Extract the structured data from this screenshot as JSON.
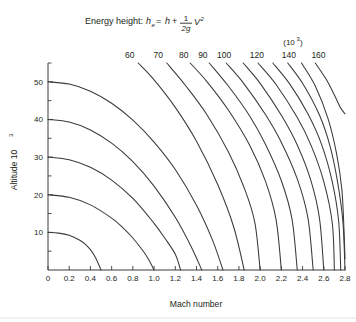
{
  "figure": {
    "background": "#ffffff",
    "line_color": "#3a3a3a",
    "text_color": "#231f20"
  },
  "title": {
    "prefix": "Energy height:",
    "var_he": "h",
    "sub_e": "e",
    "eq": "=",
    "h": "h",
    "plus": "+",
    "num": "1",
    "den": "2g",
    "v": "V",
    "v_exp": "2"
  },
  "exponent_note": {
    "open": "(10",
    "exp": "3",
    "close": ")"
  },
  "axes": {
    "x": {
      "label": "Mach number",
      "ticks": [
        "0",
        "0.2",
        "0.4",
        "0.6",
        "0.8",
        "1.0",
        "1.2",
        "1.4",
        "1.6",
        "1.8",
        "2.0",
        "2.2",
        "2.4",
        "2.6",
        "2.8"
      ],
      "min": 0,
      "max": 2.8,
      "step": 0.2
    },
    "y": {
      "label_main": "Altitude 10",
      "label_exp": "3",
      "ticks": [
        "10",
        "20",
        "30",
        "40",
        "50"
      ],
      "min": 0,
      "max": 55,
      "major_step": 10,
      "minor_step": 5
    }
  },
  "contour_labels": [
    "60",
    "70",
    "80",
    "90",
    "100",
    "120",
    "140",
    "160"
  ],
  "chart_data": {
    "type": "line",
    "xlabel": "Mach number",
    "ylabel": "Altitude 10^3",
    "xlim": [
      0,
      2.8
    ],
    "ylim": [
      0,
      55
    ],
    "grid": false,
    "legend": "none",
    "units_note": "(10^3)",
    "annotation": "Contours of constant energy height; labels in thousands of feet",
    "series": [
      {
        "name": "10",
        "label_shown": false,
        "x": [
          0.0,
          0.1,
          0.2,
          0.3,
          0.35,
          0.4,
          0.45,
          0.5
        ],
        "y": [
          10.0,
          9.8,
          9.2,
          7.9,
          6.9,
          5.4,
          3.2,
          0.0
        ]
      },
      {
        "name": "20",
        "label_shown": false,
        "x": [
          0.0,
          0.2,
          0.4,
          0.6,
          0.7,
          0.8,
          0.9,
          0.95,
          1.0
        ],
        "y": [
          20.0,
          19.3,
          17.3,
          13.8,
          11.4,
          8.5,
          4.9,
          2.7,
          0.0
        ]
      },
      {
        "name": "30",
        "label_shown": false,
        "x": [
          0.0,
          0.2,
          0.4,
          0.6,
          0.8,
          1.0,
          1.1,
          1.2,
          1.25
        ],
        "y": [
          30.0,
          29.3,
          27.3,
          23.9,
          19.0,
          12.4,
          8.5,
          4.2,
          0.0
        ]
      },
      {
        "name": "40",
        "label_shown": false,
        "x": [
          0.0,
          0.2,
          0.4,
          0.6,
          0.8,
          1.0,
          1.2,
          1.35,
          1.45
        ],
        "y": [
          40.0,
          39.3,
          37.2,
          33.7,
          28.8,
          22.3,
          14.0,
          6.2,
          0.0
        ]
      },
      {
        "name": "50",
        "label_shown": false,
        "x": [
          0.0,
          0.2,
          0.4,
          0.6,
          0.8,
          1.0,
          1.2,
          1.4,
          1.55,
          1.65
        ],
        "y": [
          50.0,
          49.4,
          47.5,
          44.3,
          39.8,
          34.0,
          26.7,
          17.2,
          8.0,
          0.0
        ]
      },
      {
        "name": "60",
        "label_shown": true,
        "x": [
          0.85,
          1.0,
          1.2,
          1.4,
          1.6,
          1.75,
          1.85
        ],
        "y": [
          55.0,
          50.5,
          43.2,
          34.2,
          22.7,
          11.5,
          0.0
        ]
      },
      {
        "name": "70",
        "label_shown": true,
        "x": [
          1.12,
          1.3,
          1.5,
          1.7,
          1.85,
          1.95,
          2.0
        ],
        "y": [
          55.0,
          48.9,
          41.2,
          31.4,
          21.8,
          12.6,
          0.0
        ]
      },
      {
        "name": "80",
        "label_shown": true,
        "x": [
          1.34,
          1.5,
          1.7,
          1.9,
          2.05,
          2.15,
          2.2
        ],
        "y": [
          55.0,
          50.0,
          42.5,
          33.2,
          23.6,
          13.4,
          0.0
        ]
      },
      {
        "name": "90",
        "label_shown": true,
        "x": [
          1.52,
          1.7,
          1.9,
          2.05,
          2.2,
          2.3,
          2.35
        ],
        "y": [
          55.0,
          48.9,
          41.0,
          33.4,
          23.7,
          13.6,
          0.0
        ]
      },
      {
        "name": "100",
        "label_shown": true,
        "x": [
          1.68,
          1.85,
          2.05,
          2.2,
          2.35,
          2.45,
          2.5
        ],
        "y": [
          55.0,
          49.4,
          41.3,
          33.9,
          24.2,
          13.9,
          0.0
        ]
      },
      {
        "name": "110",
        "label_shown": false,
        "x": [
          1.84,
          2.0,
          2.2,
          2.35,
          2.48,
          2.56,
          2.6
        ],
        "y": [
          55.0,
          49.6,
          41.1,
          33.2,
          23.6,
          13.6,
          0.0
        ]
      },
      {
        "name": "120",
        "label_shown": true,
        "x": [
          1.98,
          2.15,
          2.35,
          2.48,
          2.6,
          2.68,
          2.7
        ],
        "y": [
          55.0,
          49.3,
          40.5,
          33.1,
          23.5,
          12.5,
          0.0
        ]
      },
      {
        "name": "130",
        "label_shown": false,
        "x": [
          2.12,
          2.28,
          2.45,
          2.58,
          2.68,
          2.74,
          2.76
        ],
        "y": [
          55.0,
          49.4,
          41.5,
          33.3,
          23.4,
          13.0,
          0.0
        ]
      },
      {
        "name": "140",
        "label_shown": true,
        "x": [
          2.26,
          2.4,
          2.56,
          2.66,
          2.73,
          2.78,
          2.8
        ],
        "y": [
          55.0,
          49.6,
          41.1,
          32.8,
          23.4,
          12.9,
          0.0
        ]
      },
      {
        "name": "150",
        "label_shown": false,
        "x": [
          2.39,
          2.52,
          2.64,
          2.72,
          2.77,
          2.79,
          2.8
        ],
        "y": [
          55.0,
          48.9,
          40.2,
          31.0,
          21.5,
          11.0,
          3.0
        ]
      },
      {
        "name": "160",
        "label_shown": true,
        "x": [
          2.52,
          2.62,
          2.7,
          2.75,
          2.78,
          2.8
        ],
        "y": [
          55.0,
          50.8,
          46.5,
          43.5,
          42.2,
          41.5
        ]
      }
    ],
    "label_positions": [
      {
        "name": "60",
        "x": 0.77,
        "ytext": 57.5
      },
      {
        "name": "70",
        "x": 1.04,
        "ytext": 57.5
      },
      {
        "name": "80",
        "x": 1.28,
        "ytext": 57.5
      },
      {
        "name": "90",
        "x": 1.46,
        "ytext": 57.5
      },
      {
        "name": "100",
        "x": 1.66,
        "ytext": 57.5
      },
      {
        "name": "120",
        "x": 1.97,
        "ytext": 57.5
      },
      {
        "name": "140",
        "x": 2.27,
        "ytext": 57.5
      },
      {
        "name": "160",
        "x": 2.55,
        "ytext": 57.5
      }
    ]
  }
}
